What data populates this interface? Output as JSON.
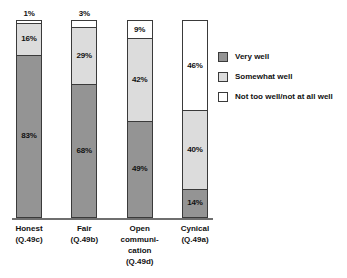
{
  "chart_data": {
    "type": "bar",
    "subtype": "100% stacked column",
    "title": "",
    "xlabel": "",
    "ylabel": "",
    "ylim": [
      0,
      100
    ],
    "grid": false,
    "legend_position": "right",
    "categories": [
      {
        "lines": [
          "Honest",
          "(Q.49c)"
        ]
      },
      {
        "lines": [
          "Fair",
          "(Q.49b)"
        ]
      },
      {
        "lines": [
          "Open",
          "communi-",
          "cation",
          "(Q.49d)"
        ]
      },
      {
        "lines": [
          "Cynical",
          "(Q.49a)"
        ]
      }
    ],
    "series": [
      {
        "name": "Very well",
        "color": "#949494",
        "values": [
          83,
          68,
          49,
          14
        ]
      },
      {
        "name": "Somewhat well",
        "color": "#dcdcdc",
        "values": [
          16,
          29,
          42,
          40
        ]
      },
      {
        "name": "Not too well/not at all well",
        "color": "#ffffff",
        "values": [
          1,
          3,
          9,
          46
        ]
      }
    ],
    "bars": [
      {
        "category": "Honest",
        "segments": [
          {
            "series": "Not too well/not at all well",
            "value": 1,
            "label": "1%",
            "label_outside": true
          },
          {
            "series": "Somewhat well",
            "value": 16,
            "label": "16%",
            "label_outside": false
          },
          {
            "series": "Very well",
            "value": 83,
            "label": "83%",
            "label_outside": false
          }
        ]
      },
      {
        "category": "Fair",
        "segments": [
          {
            "series": "Not too well/not at all well",
            "value": 3,
            "label": "3%",
            "label_outside": true
          },
          {
            "series": "Somewhat well",
            "value": 29,
            "label": "29%",
            "label_outside": false
          },
          {
            "series": "Very well",
            "value": 68,
            "label": "68%",
            "label_outside": false
          }
        ]
      },
      {
        "category": "Open communication",
        "segments": [
          {
            "series": "Not too well/not at all well",
            "value": 9,
            "label": "9%",
            "label_outside": false
          },
          {
            "series": "Somewhat well",
            "value": 42,
            "label": "42%",
            "label_outside": false
          },
          {
            "series": "Very well",
            "value": 49,
            "label": "49%",
            "label_outside": false
          }
        ]
      },
      {
        "category": "Cynical",
        "segments": [
          {
            "series": "Not too well/not at all well",
            "value": 46,
            "label": "46%",
            "label_outside": false
          },
          {
            "series": "Somewhat well",
            "value": 40,
            "label": "40%",
            "label_outside": false
          },
          {
            "series": "Very well",
            "value": 14,
            "label": "14%",
            "label_outside": false
          }
        ]
      }
    ]
  },
  "legend": {
    "items": [
      {
        "label": "Very well",
        "color": "#949494"
      },
      {
        "label": "Somewhat well",
        "color": "#dcdcdc"
      },
      {
        "label": "Not too well/not at all well",
        "color": "#ffffff"
      }
    ]
  },
  "colors": {
    "very_well": "#949494",
    "somewhat_well": "#dcdcdc",
    "not_well": "#ffffff",
    "outline": "#3a3a3a",
    "axis": "#6f6f6f",
    "text": "#111111"
  }
}
